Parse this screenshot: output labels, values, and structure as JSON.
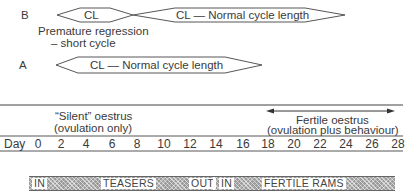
{
  "rows": {
    "b": {
      "label": "B",
      "short_cycle_label": "CL",
      "normal_cycle_label": "CL — Normal cycle length",
      "note_line1": "Premature regression",
      "note_line2": "– short cycle"
    },
    "a": {
      "label": "A",
      "normal_cycle_label": "CL — Normal cycle length"
    }
  },
  "oestrus": {
    "silent_line1": "“Silent” oestrus",
    "silent_line2": "(ovulation only)",
    "fertile_line1": "Fertile oestrus",
    "fertile_line2": "(ovulation plus behaviour)"
  },
  "axis": {
    "label": "Day",
    "ticks": [
      "0",
      "2",
      "4",
      "6",
      "8",
      "10",
      "12",
      "14",
      "16",
      "18",
      "20",
      "22",
      "24",
      "26",
      "28"
    ]
  },
  "ram_bar": {
    "segments": [
      "IN",
      "TEASERS",
      "OUT",
      "IN",
      "FERTILE RAMS"
    ]
  },
  "colors": {
    "ink": "#3a3a3a",
    "bar_fill": "#9a9a9a",
    "background": "#ffffff"
  }
}
